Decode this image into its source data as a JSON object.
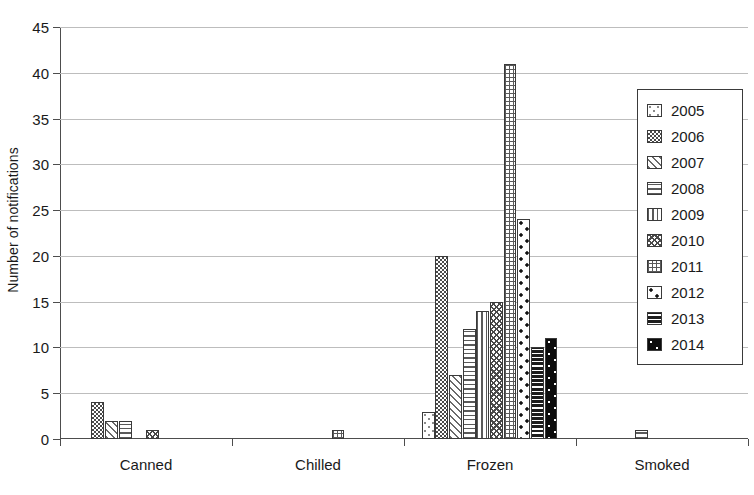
{
  "chart_data": {
    "type": "bar",
    "title": "",
    "xlabel": "",
    "ylabel": "Number of notifications",
    "categories": [
      "Canned",
      "Chilled",
      "Frozen",
      "Smoked"
    ],
    "ylim": [
      0,
      45
    ],
    "yticks": [
      0,
      5,
      10,
      15,
      20,
      25,
      30,
      35,
      40,
      45
    ],
    "grid": "horizontal",
    "legend_position": "right",
    "series": [
      {
        "name": "2005",
        "values": [
          0,
          0,
          3,
          0
        ]
      },
      {
        "name": "2006",
        "values": [
          4,
          0,
          20,
          0
        ]
      },
      {
        "name": "2007",
        "values": [
          2,
          0,
          7,
          0
        ]
      },
      {
        "name": "2008",
        "values": [
          2,
          0,
          12,
          1
        ]
      },
      {
        "name": "2009",
        "values": [
          0,
          0,
          14,
          0
        ]
      },
      {
        "name": "2010",
        "values": [
          1,
          0,
          15,
          0
        ]
      },
      {
        "name": "2011",
        "values": [
          0,
          1,
          41,
          0
        ]
      },
      {
        "name": "2012",
        "values": [
          0,
          0,
          24,
          0
        ]
      },
      {
        "name": "2013",
        "values": [
          0,
          0,
          10,
          0
        ]
      },
      {
        "name": "2014",
        "values": [
          0,
          0,
          11,
          0
        ]
      }
    ]
  },
  "legend": {
    "items": [
      {
        "label": "2005",
        "pattern": "light-dotted"
      },
      {
        "label": "2006",
        "pattern": "dense-checkerboard"
      },
      {
        "label": "2007",
        "pattern": "diagonal-hatch"
      },
      {
        "label": "2008",
        "pattern": "horizontal-lines"
      },
      {
        "label": "2009",
        "pattern": "vertical-lines"
      },
      {
        "label": "2010",
        "pattern": "crosshatch-diagonal"
      },
      {
        "label": "2011",
        "pattern": "grid"
      },
      {
        "label": "2012",
        "pattern": "large-dots"
      },
      {
        "label": "2013",
        "pattern": "black-horizontal-lines"
      },
      {
        "label": "2014",
        "pattern": "black-dots"
      }
    ]
  },
  "colors": {
    "axis": "#4d4d4d",
    "gridline": "#bdbdbd",
    "text": "#1a1a1a",
    "background": "#ffffff"
  }
}
